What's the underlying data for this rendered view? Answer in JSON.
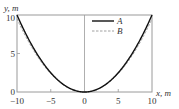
{
  "chart_data": {
    "type": "line",
    "title": "",
    "xlabel": "x, m",
    "ylabel": "y, m",
    "xlim": [
      -10,
      10
    ],
    "ylim": [
      0,
      10
    ],
    "xticks": [
      -10,
      -5,
      0,
      5,
      10
    ],
    "yticks": [
      0,
      5,
      10
    ],
    "xtick_labels": [
      "−10",
      "−5",
      "0",
      "5",
      "10"
    ],
    "ytick_labels": [
      "0",
      "5",
      "10"
    ],
    "grid": false,
    "legend_position": "upper right",
    "x": [
      -10,
      -8,
      -6,
      -4,
      -2,
      0,
      2,
      4,
      6,
      8,
      10
    ],
    "series": [
      {
        "name": "A",
        "style": "solid",
        "color": "#111111",
        "values": [
          10,
          6.4,
          3.6,
          1.6,
          0.4,
          0,
          0.4,
          1.6,
          3.6,
          6.4,
          10
        ]
      },
      {
        "name": "B",
        "style": "dashed",
        "color": "#999999",
        "values": [
          9.5,
          6.1,
          3.4,
          1.5,
          0.4,
          0,
          0.4,
          1.5,
          3.4,
          6.1,
          9.5
        ]
      }
    ]
  },
  "labels": {
    "y_axis": "y, m",
    "x_axis": "x, m",
    "legend_a": "A",
    "legend_b": "B",
    "xt0": "−10",
    "xt1": "−5",
    "xt2": "0",
    "xt3": "5",
    "xt4": "10",
    "yt0": "0",
    "yt1": "5",
    "yt2": "10"
  }
}
